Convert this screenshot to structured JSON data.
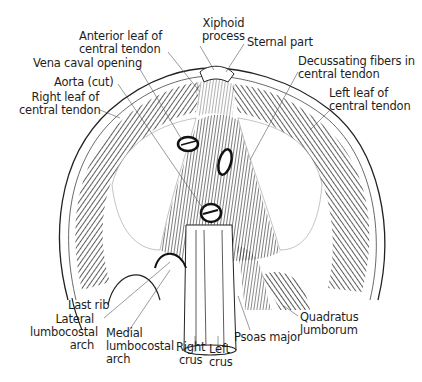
{
  "figure": {
    "labels": {
      "xiphoid_process": [
        "Xiphoid",
        "process"
      ],
      "anterior_leaf": [
        "Anterior leaf of",
        "central tendon"
      ],
      "sternal_part": [
        "Sternal part"
      ],
      "vena_caval_opening": [
        "Vena caval opening"
      ],
      "decussating_fibers": [
        "Decussating fibers in",
        "central tendon"
      ],
      "aorta_cut": [
        "Aorta (cut)"
      ],
      "right_leaf": [
        "Right leaf of",
        "central tendon"
      ],
      "left_leaf": [
        "Left leaf of",
        "central tendon"
      ],
      "last_rib": [
        "Last rib"
      ],
      "lateral_arch": [
        "Lateral",
        "lumbocostal",
        "arch"
      ],
      "medial_arch": [
        "Medial",
        "lumbocostal",
        "arch"
      ],
      "right_crus": [
        "Right",
        "crus"
      ],
      "left_crus": [
        "Left",
        "crus"
      ],
      "psoas_major": [
        "Psoas major"
      ],
      "quadratus_lumborum": [
        "Quadratus",
        "lumborum"
      ]
    },
    "colors": {
      "ink": "#1a1a1a",
      "background": "#ffffff",
      "leader": "#555555"
    }
  }
}
